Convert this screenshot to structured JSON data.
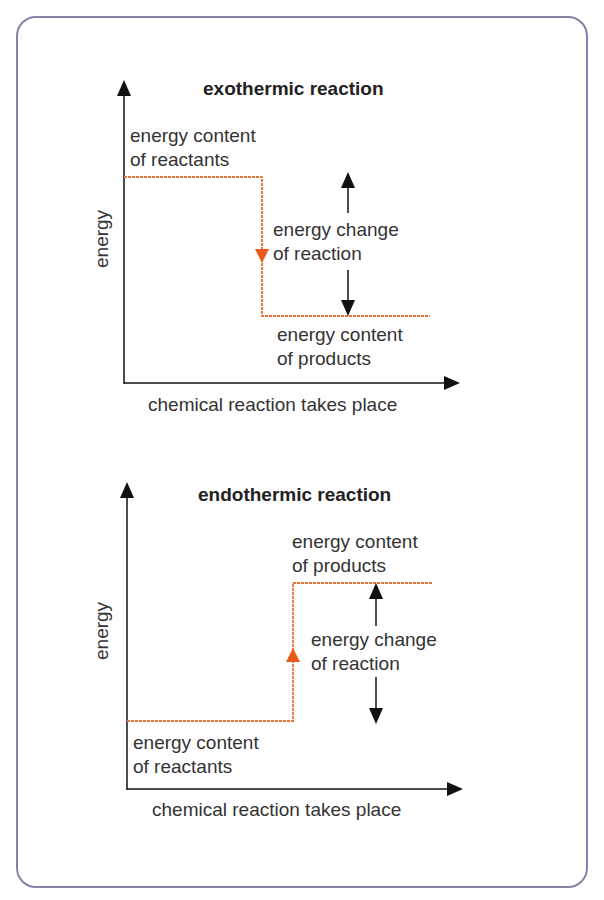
{
  "colors": {
    "border": "#8a7fa8",
    "axis": "#111111",
    "level_line": "#e8703a",
    "direction_arrow": "#e85a1a"
  },
  "diagrams": [
    {
      "title": "exothermic reaction",
      "y_axis_label": "energy",
      "x_axis_label": "chemical reaction takes place",
      "reactants_label": [
        "energy content",
        "of reactants"
      ],
      "products_label": [
        "energy content",
        "of products"
      ],
      "change_label": [
        "energy change",
        "of reaction"
      ]
    },
    {
      "title": "endothermic reaction",
      "y_axis_label": "energy",
      "x_axis_label": "chemical reaction takes place",
      "products_label": [
        "energy content",
        "of products"
      ],
      "change_label": [
        "energy change",
        "of reaction"
      ],
      "reactants_label": [
        "energy content",
        "of reactants"
      ]
    }
  ]
}
